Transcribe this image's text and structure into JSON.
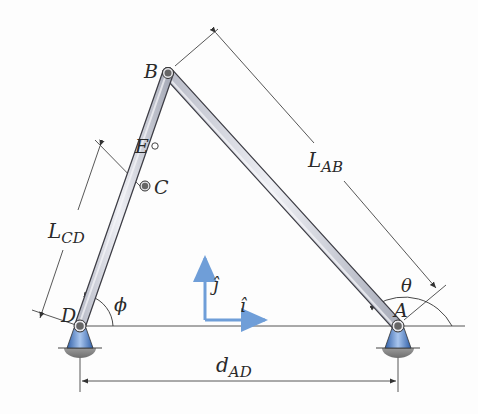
{
  "diagram": {
    "points": {
      "A": {
        "label": "A"
      },
      "B": {
        "label": "B"
      },
      "C": {
        "label": "C"
      },
      "D": {
        "label": "D"
      },
      "E": {
        "label": "E"
      }
    },
    "dimensions": {
      "L_AB": {
        "main": "L",
        "sub": "AB"
      },
      "L_CD": {
        "main": "L",
        "sub": "CD"
      },
      "d_AD": {
        "main": "d",
        "sub": "AD"
      }
    },
    "angles": {
      "theta": "θ",
      "phi": "ϕ"
    },
    "axes": {
      "i_hat": "î",
      "j_hat": "ĵ"
    },
    "colors": {
      "axis_arrow": "#6f9ed8",
      "support_blue": "#4a78c0",
      "ground_gray": "#8a8a8a",
      "link_fill": "#d9dbe3",
      "line": "#3a3a3a"
    }
  }
}
